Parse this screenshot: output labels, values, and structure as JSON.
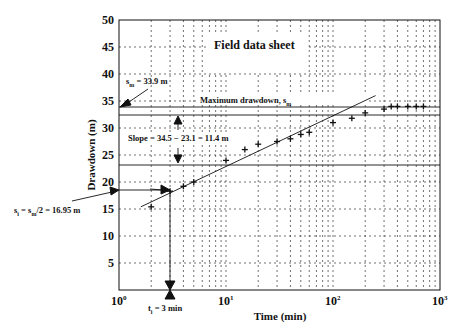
{
  "chart_data": {
    "type": "scatter",
    "title": "Field data sheet",
    "xlabel": "Time (min)",
    "ylabel": "Drawdown (m)",
    "xscale": "log",
    "xlim": [
      1,
      1000
    ],
    "ylim": [
      0,
      50
    ],
    "grid": true,
    "x_tick_labels": [
      "10^0",
      "10^1",
      "10^2",
      "10^3"
    ],
    "y_tick_labels": [
      "5",
      "10",
      "15",
      "20",
      "25",
      "30",
      "35",
      "40",
      "45",
      "50"
    ],
    "series": [
      {
        "name": "Field data",
        "marker": "+",
        "points": [
          {
            "x": 2,
            "y": 15.4
          },
          {
            "x": 3,
            "y": 18.3
          },
          {
            "x": 4,
            "y": 19.2
          },
          {
            "x": 5,
            "y": 20.0
          },
          {
            "x": 10,
            "y": 24.0
          },
          {
            "x": 15,
            "y": 26.0
          },
          {
            "x": 20,
            "y": 27.0
          },
          {
            "x": 30,
            "y": 27.5
          },
          {
            "x": 40,
            "y": 28.0
          },
          {
            "x": 50,
            "y": 28.8
          },
          {
            "x": 60,
            "y": 29.2
          },
          {
            "x": 100,
            "y": 31.0
          },
          {
            "x": 150,
            "y": 31.8
          },
          {
            "x": 200,
            "y": 32.8
          },
          {
            "x": 300,
            "y": 33.5
          },
          {
            "x": 350,
            "y": 34.0
          },
          {
            "x": 400,
            "y": 34.0
          },
          {
            "x": 500,
            "y": 34.0
          },
          {
            "x": 600,
            "y": 34.0
          },
          {
            "x": 700,
            "y": 34.0
          }
        ]
      },
      {
        "name": "Fitted straight line",
        "type": "line",
        "points": [
          {
            "x": 1.6,
            "y": 15.4
          },
          {
            "x": 250,
            "y": 36.0
          }
        ]
      }
    ],
    "reference_lines": [
      {
        "type": "horizontal",
        "y": 33.9,
        "label": "Maximum drawdown, s_m"
      },
      {
        "type": "horizontal",
        "y": 32.3
      },
      {
        "type": "horizontal",
        "y": 23.1
      },
      {
        "type": "horizontal",
        "y": 18.5,
        "x_to": 3
      },
      {
        "type": "vertical",
        "x": 3,
        "y_to": 18.5
      }
    ],
    "annotations": [
      {
        "text": "s_m = 33.9 m",
        "target": {
          "x": 1,
          "y": 33.9
        }
      },
      {
        "text": "Maximum drawdown, s_m"
      },
      {
        "text": "Slope = 34.5 − 23.1 = 11.4 m"
      },
      {
        "text": "s_i = s_m/2 = 16.95 m",
        "target": {
          "x": 1,
          "y": 18.5
        }
      },
      {
        "text": "t_i = 3 min",
        "target": {
          "x": 3,
          "y": 0
        }
      }
    ]
  },
  "labels": {
    "title": "Field data sheet",
    "xlabel": "Time (min)",
    "ylabel": "Drawdown (m)",
    "sm_prefix": "s",
    "sm_sub": "m",
    "sm_value": " = 33.9 m",
    "max_dd": "Maximum drawdown, s",
    "max_dd_sub": "m",
    "slope": "Slope = 34.5 − 23.1 = 11.4 m",
    "si_a": "s",
    "si_a_sub": "i",
    "si_b": " = s",
    "si_b_sub": "m",
    "si_c": "/2 = 16.95 m",
    "ti_a": "t",
    "ti_sub": "i",
    "ti_b": " = 3 min",
    "x10": "10",
    "xexp0": "0",
    "xexp1": "1",
    "xexp2": "2",
    "xexp3": "3",
    "y5": "5",
    "y10": "10",
    "y15": "15",
    "y20": "20",
    "y25": "25",
    "y30": "30",
    "y35": "35",
    "y40": "40",
    "y45": "45",
    "y50": "50"
  }
}
